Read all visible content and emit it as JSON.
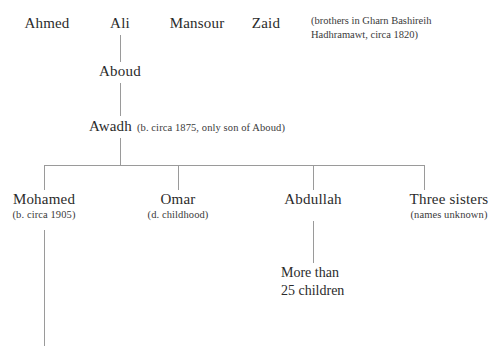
{
  "diagram": {
    "line_color": "#9a9a9a",
    "text_color": "#2b2b2b"
  },
  "generation_1": {
    "label": "brothers",
    "members": [
      {
        "name": "Ahmed"
      },
      {
        "name": "Ali"
      },
      {
        "name": "Mansour"
      },
      {
        "name": "Zaid"
      }
    ],
    "annotation": "(brothers in Gharn Bashireih\nHadhramawt, circa 1820)"
  },
  "generation_2": {
    "name": "Aboud"
  },
  "generation_3": {
    "name": "Awadh",
    "note": "(b. circa 1875, only son of  Aboud)"
  },
  "generation_4": {
    "children": [
      {
        "name": "Mohamed",
        "note": "(b. circa 1905)"
      },
      {
        "name": "Omar",
        "note": "(d. childhood)"
      },
      {
        "name": "Abdullah",
        "note": ""
      },
      {
        "name": "Three sisters",
        "note": "(names unknown)"
      }
    ]
  },
  "generation_5": {
    "abdullah_children": "More than\n25 children"
  }
}
